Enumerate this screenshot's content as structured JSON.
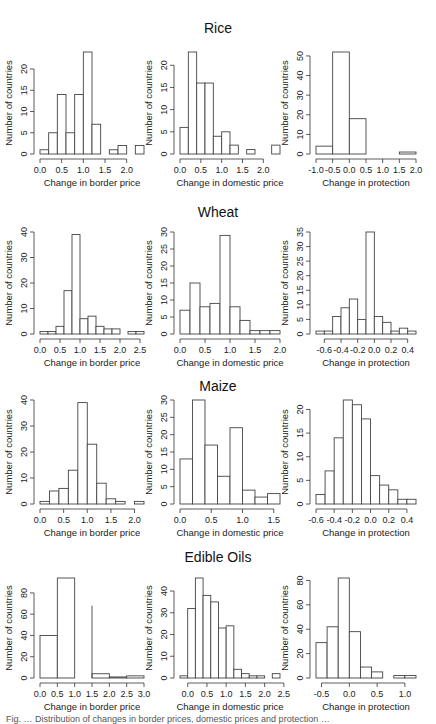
{
  "figure": {
    "row_titles": [
      "Rice",
      "Wheat",
      "Maize",
      "Edible Oils"
    ],
    "ylabel": "Number of countries",
    "caption_partial": "Fig. … Distribution of changes in border prices, domestic prices and protection …"
  },
  "chart_data": [
    {
      "type": "bar",
      "row": "Rice",
      "title": "",
      "xlabel": "Change in border price",
      "ylabel": "Number of countries",
      "bin_start": 0.0,
      "bin_width": 0.2,
      "values": [
        1,
        5,
        14,
        5,
        14,
        24,
        7,
        0,
        1,
        2,
        0,
        2
      ],
      "xlim": [
        0.0,
        2.4
      ],
      "xticks": [
        0.0,
        0.5,
        1.0,
        1.5,
        2.0
      ],
      "xtick_labels": [
        "0.0",
        "0.5",
        "1.0",
        "1.5",
        "2.0"
      ],
      "ylim": [
        0,
        24
      ],
      "yticks": [
        0,
        5,
        10,
        15,
        20
      ]
    },
    {
      "type": "bar",
      "row": "Rice",
      "title": "Rice",
      "xlabel": "Change in domestic price",
      "ylabel": "Number of countries",
      "bin_start": 0.0,
      "bin_width": 0.2,
      "values": [
        6,
        23,
        16,
        16,
        4,
        5,
        2,
        0,
        1,
        0,
        0,
        2
      ],
      "xlim": [
        0.0,
        2.4
      ],
      "xticks": [
        0.0,
        0.5,
        1.0,
        1.5,
        2.0
      ],
      "xtick_labels": [
        "0.0",
        "0.5",
        "1.0",
        "1.5",
        "2.0"
      ],
      "ylim": [
        0,
        23
      ],
      "yticks": [
        0,
        5,
        10,
        15,
        20
      ]
    },
    {
      "type": "bar",
      "row": "Rice",
      "title": "",
      "xlabel": "Change in protection",
      "ylabel": "Number of countries",
      "bin_start": -1.0,
      "bin_width": 0.5,
      "values": [
        4,
        52,
        18,
        0,
        0,
        1
      ],
      "xlim": [
        -1.0,
        2.0
      ],
      "xticks": [
        -1.0,
        -0.5,
        0.0,
        0.5,
        1.0,
        1.5,
        2.0
      ],
      "xtick_labels": [
        "-1.0",
        "-0.5",
        "0.0",
        "0.5",
        "1.0",
        "1.5",
        "2.0"
      ],
      "ylim": [
        0,
        52
      ],
      "yticks": [
        0,
        10,
        20,
        30,
        40,
        50
      ]
    },
    {
      "type": "bar",
      "row": "Wheat",
      "title": "",
      "xlabel": "Change in border price",
      "ylabel": "Number of countries",
      "bin_start": 0.0,
      "bin_width": 0.2,
      "values": [
        1,
        1,
        3,
        17,
        39,
        6,
        7,
        3,
        2,
        2,
        0,
        1,
        1
      ],
      "xlim": [
        0.0,
        2.6
      ],
      "xticks": [
        0.0,
        0.5,
        1.0,
        1.5,
        2.0,
        2.5
      ],
      "xtick_labels": [
        "0.0",
        "0.5",
        "1.0",
        "1.5",
        "2.0",
        "2.5"
      ],
      "ylim": [
        0,
        40
      ],
      "yticks": [
        0,
        10,
        20,
        30,
        40
      ]
    },
    {
      "type": "bar",
      "row": "Wheat",
      "title": "Wheat",
      "xlabel": "Change in domestic price",
      "ylabel": "Number of countries",
      "bin_start": 0.0,
      "bin_width": 0.2,
      "values": [
        7,
        15,
        8,
        9,
        29,
        8,
        4,
        1,
        1,
        1
      ],
      "xlim": [
        0.0,
        2.0
      ],
      "xticks": [
        0.0,
        0.5,
        1.0,
        1.5,
        2.0
      ],
      "xtick_labels": [
        "0.0",
        "0.5",
        "1.0",
        "1.5",
        "2.0"
      ],
      "ylim": [
        0,
        30
      ],
      "yticks": [
        0,
        5,
        10,
        15,
        20,
        25,
        30
      ]
    },
    {
      "type": "bar",
      "row": "Wheat",
      "title": "",
      "xlabel": "Change in protection",
      "ylabel": "Number of countries",
      "bin_start": -0.7,
      "bin_width": 0.1,
      "values": [
        1,
        1,
        6,
        9,
        12,
        5,
        35,
        6,
        4,
        1,
        2,
        1
      ],
      "xlim": [
        -0.7,
        0.5
      ],
      "xticks": [
        -0.6,
        -0.4,
        -0.2,
        0.0,
        0.2,
        0.4
      ],
      "xtick_labels": [
        "-0.6",
        "-0.4",
        "-0.2",
        "0.0",
        "0.2",
        "0.4"
      ],
      "ylim": [
        0,
        35
      ],
      "yticks": [
        0,
        5,
        10,
        15,
        20,
        25,
        30,
        35
      ]
    },
    {
      "type": "bar",
      "row": "Maize",
      "title": "",
      "xlabel": "Change in border price",
      "ylabel": "Number of countries",
      "bin_start": 0.0,
      "bin_width": 0.2,
      "values": [
        1,
        5,
        6,
        13,
        39,
        23,
        8,
        2,
        1,
        0,
        1
      ],
      "xlim": [
        0.0,
        2.2
      ],
      "xticks": [
        0.0,
        0.5,
        1.0,
        1.5,
        2.0
      ],
      "xtick_labels": [
        "0.0",
        "0.5",
        "1.0",
        "1.5",
        "2.0"
      ],
      "ylim": [
        0,
        40
      ],
      "yticks": [
        0,
        10,
        20,
        30,
        40
      ]
    },
    {
      "type": "bar",
      "row": "Maize",
      "title": "Maize",
      "xlabel": "Change in domestic price",
      "ylabel": "Number of countries",
      "bin_start": 0.0,
      "bin_width": 0.2,
      "values": [
        13,
        30,
        17,
        8,
        22,
        4,
        2,
        3
      ],
      "xlim": [
        0.0,
        1.6
      ],
      "xticks": [
        0.0,
        0.5,
        1.0,
        1.5
      ],
      "xtick_labels": [
        "0.0",
        "0.5",
        "1.0",
        "1.5"
      ],
      "ylim": [
        0,
        30
      ],
      "yticks": [
        0,
        5,
        10,
        15,
        20,
        25,
        30
      ]
    },
    {
      "type": "bar",
      "row": "Maize",
      "title": "",
      "xlabel": "Change in protection",
      "ylabel": "Number of countries",
      "bin_start": -0.6,
      "bin_width": 0.1,
      "values": [
        2,
        7,
        14,
        22,
        21,
        18,
        6,
        4,
        3,
        1,
        1
      ],
      "xlim": [
        -0.6,
        0.5
      ],
      "xticks": [
        -0.6,
        -0.4,
        -0.2,
        0.0,
        0.2,
        0.4
      ],
      "xtick_labels": [
        "-0.6",
        "-0.4",
        "-0.2",
        "0.0",
        "0.2",
        "0.4"
      ],
      "ylim": [
        0,
        22
      ],
      "yticks": [
        0,
        5,
        10,
        15,
        20
      ]
    },
    {
      "type": "bar",
      "row": "Edible Oils",
      "title": "",
      "xlabel": "Change in border price",
      "ylabel": "Number of countries",
      "bin_start": 0.0,
      "bin_width": 0.5,
      "values": [
        40,
        94,
        0,
        4,
        1,
        2
      ],
      "extra_line": {
        "x": 1.5,
        "y": 68
      },
      "xlim": [
        0.0,
        3.0
      ],
      "xticks": [
        0.0,
        0.5,
        1.0,
        1.5,
        2.0,
        2.5,
        3.0
      ],
      "xtick_labels": [
        "0.0",
        "0.5",
        "1.0",
        "1.5",
        "2.0",
        "2.5",
        "3.0"
      ],
      "ylim": [
        0,
        94
      ],
      "yticks": [
        0,
        20,
        40,
        60,
        80
      ]
    },
    {
      "type": "bar",
      "row": "Edible Oils",
      "title": "Edible Oils",
      "xlabel": "Change in domestic price",
      "ylabel": "Number of countries",
      "bin_start": -0.2,
      "bin_width": 0.2,
      "values": [
        1,
        32,
        46,
        38,
        35,
        23,
        24,
        4,
        2,
        1,
        1,
        0,
        2
      ],
      "xlim": [
        -0.2,
        2.4
      ],
      "xticks": [
        0.0,
        0.5,
        1.0,
        1.5,
        2.0,
        2.5
      ],
      "xtick_labels": [
        "0.0",
        "0.5",
        "1.0",
        "1.5",
        "2.0",
        "2.5"
      ],
      "ylim": [
        0,
        46
      ],
      "yticks": [
        0,
        10,
        20,
        30,
        40
      ]
    },
    {
      "type": "bar",
      "row": "Edible Oils",
      "title": "",
      "xlabel": "Change in protection",
      "ylabel": "Number of countries",
      "bin_start": -0.6,
      "bin_width": 0.2,
      "values": [
        29,
        42,
        82,
        38,
        9,
        5,
        0,
        2,
        2
      ],
      "xlim": [
        -0.6,
        1.2
      ],
      "xticks": [
        -0.5,
        0.0,
        0.5,
        1.0
      ],
      "xtick_labels": [
        "-0.5",
        "0.0",
        "0.5",
        "1.0"
      ],
      "ylim": [
        0,
        82
      ],
      "yticks": [
        0,
        20,
        40,
        60,
        80
      ]
    }
  ]
}
